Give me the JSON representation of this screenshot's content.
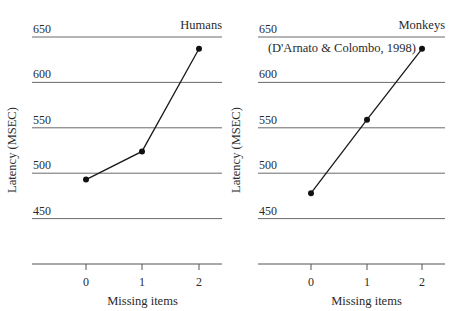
{
  "chart_data": [
    {
      "type": "line",
      "title": "Humans",
      "subtitle": "",
      "xlabel": "Missing items",
      "ylabel": "Latency (MSEC)",
      "x": [
        0,
        1,
        2
      ],
      "x_tick_labels": [
        "0",
        "1",
        "2"
      ],
      "y_tick_labels": [
        "650",
        "600",
        "550",
        "500",
        "450"
      ],
      "ylim": [
        400,
        650
      ],
      "grid": true,
      "series": [
        {
          "name": "Humans",
          "values": [
            493,
            524,
            637
          ]
        }
      ]
    },
    {
      "type": "line",
      "title": "Monkeys",
      "subtitle": "(D'Arnato & Colombo, 1998)",
      "xlabel": "Missing items",
      "ylabel": "Latency (MSEC)",
      "x": [
        0,
        1,
        2
      ],
      "x_tick_labels": [
        "0",
        "1",
        "2"
      ],
      "y_tick_labels": [
        "650",
        "600",
        "550",
        "500",
        "450"
      ],
      "ylim": [
        400,
        650
      ],
      "grid": true,
      "series": [
        {
          "name": "Monkeys",
          "values": [
            478,
            559,
            637
          ]
        }
      ]
    }
  ]
}
